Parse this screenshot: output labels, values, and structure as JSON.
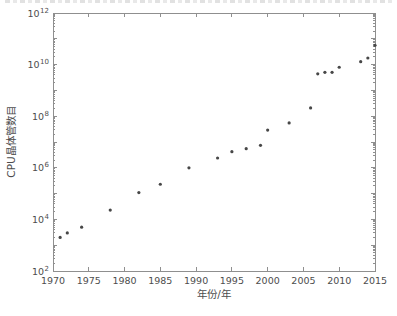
{
  "page": {
    "background_color": "#ffffff",
    "caption_clipped_at_top": true
  },
  "colors": {
    "axis": "#8f8f8f",
    "tick": "#8f8f8f",
    "text": "#4d4d4d",
    "marker": "#474747"
  },
  "chart_data": {
    "type": "scatter",
    "title": "",
    "xlabel": "年份/年",
    "ylabel": "CPU晶体管数目",
    "y_scale": "log",
    "grid": false,
    "legend": null,
    "xlim": [
      1970,
      2015
    ],
    "ylim_exponents": [
      2,
      12
    ],
    "xticks": [
      1970,
      1975,
      1980,
      1985,
      1990,
      1995,
      2000,
      2005,
      2010,
      2015
    ],
    "ytick_exponents": [
      2,
      4,
      6,
      8,
      10,
      12
    ],
    "ytick_base": "10",
    "points": [
      {
        "year": 1971,
        "transistors": 2000
      },
      {
        "year": 1972,
        "transistors": 3000
      },
      {
        "year": 1974,
        "transistors": 5000
      },
      {
        "year": 1978,
        "transistors": 23000
      },
      {
        "year": 1982,
        "transistors": 110000
      },
      {
        "year": 1985,
        "transistors": 230000
      },
      {
        "year": 1989,
        "transistors": 1000000
      },
      {
        "year": 1993,
        "transistors": 2400000
      },
      {
        "year": 1995,
        "transistors": 4200000
      },
      {
        "year": 1997,
        "transistors": 5500000
      },
      {
        "year": 1999,
        "transistors": 7400000
      },
      {
        "year": 2000,
        "transistors": 29000000
      },
      {
        "year": 2003,
        "transistors": 55000000
      },
      {
        "year": 2006,
        "transistors": 210000000
      },
      {
        "year": 2007,
        "transistors": 4400000000
      },
      {
        "year": 2008,
        "transistors": 5000000000
      },
      {
        "year": 2009,
        "transistors": 5000000000
      },
      {
        "year": 2010,
        "transistors": 7900000000
      },
      {
        "year": 2013,
        "transistors": 13000000000
      },
      {
        "year": 2014,
        "transistors": 18000000000
      },
      {
        "year": 2015,
        "transistors": 56000000000
      }
    ]
  }
}
